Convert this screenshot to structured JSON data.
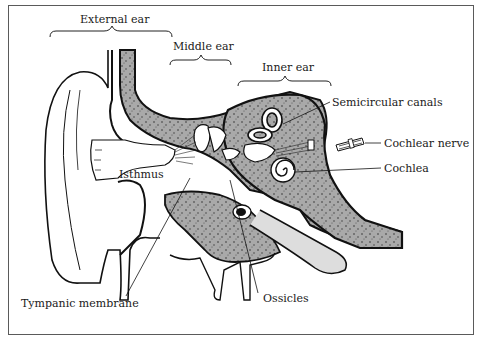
{
  "diagram": {
    "type": "anatomical-cross-section",
    "colors": {
      "bone": "#a9a9a9",
      "outline": "#111111",
      "background": "#ffffff",
      "frame": "#5a5a5a"
    },
    "region_labels": [
      {
        "id": "external-ear",
        "text": "External ear"
      },
      {
        "id": "middle-ear",
        "text": "Middle ear"
      },
      {
        "id": "inner-ear",
        "text": "Inner ear"
      }
    ],
    "structure_labels": [
      {
        "id": "semicircular-canals",
        "text": "Semicircular canals"
      },
      {
        "id": "cochlear-nerve",
        "text": "Cochlear nerve"
      },
      {
        "id": "cochlea",
        "text": "Cochlea"
      },
      {
        "id": "isthmus",
        "text": "Isthmus"
      },
      {
        "id": "tympanic-membrane",
        "text": "Tympanic membrane"
      },
      {
        "id": "ossicles",
        "text": "Ossicles"
      }
    ]
  }
}
